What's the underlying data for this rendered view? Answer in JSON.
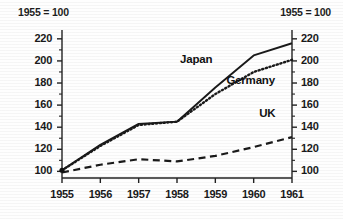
{
  "chart_data": {
    "type": "line",
    "title": "",
    "subtitle": "",
    "note_left": "1955 = 100",
    "note_right": "1955 = 100",
    "xlabel": "",
    "ylabel": "",
    "x": [
      "1955",
      "1956",
      "1957",
      "1958",
      "1959",
      "1960",
      "1961"
    ],
    "categories": [
      "1955",
      "1956",
      "1957",
      "1958",
      "1959",
      "1960",
      "1961"
    ],
    "ylim": [
      94,
      228
    ],
    "y_ticks": [
      "100",
      "120",
      "140",
      "160",
      "180",
      "200",
      "220"
    ],
    "y_tick_values": [
      100,
      120,
      140,
      160,
      180,
      200,
      220
    ],
    "y_minor_ticks": [
      110,
      130,
      150,
      170,
      190,
      210
    ],
    "grid": false,
    "legend": "inline-annotations",
    "series": [
      {
        "name": "Japan",
        "style": "solid",
        "values": [
          101,
          124,
          143,
          145,
          176,
          205,
          216
        ]
      },
      {
        "name": "Germany",
        "style": "dotted",
        "values": [
          101,
          123,
          142,
          145,
          170,
          190,
          201
        ]
      },
      {
        "name": "UK",
        "style": "dashed",
        "values": [
          99,
          106,
          111,
          109,
          114,
          122,
          131
        ]
      }
    ],
    "annotations": [
      {
        "text": "Japan",
        "series": "Japan"
      },
      {
        "text": "Germany",
        "series": "Germany"
      },
      {
        "text": "UK",
        "series": "UK"
      }
    ],
    "colors": {
      "ink": "#1a1a1a",
      "background": "#fefefe"
    }
  }
}
